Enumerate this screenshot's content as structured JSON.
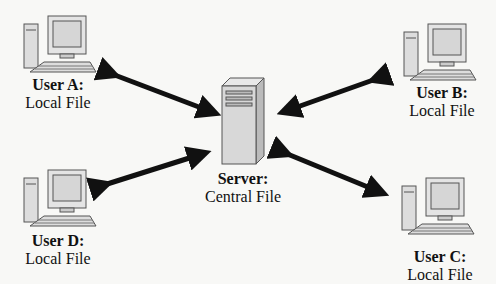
{
  "diagram": {
    "server": {
      "title": "Server:",
      "subtitle": "Central File"
    },
    "users": [
      {
        "id": "a",
        "title": "User A:",
        "subtitle": "Local File"
      },
      {
        "id": "b",
        "title": "User B:",
        "subtitle": "Local File"
      },
      {
        "id": "c",
        "title": "User C:",
        "subtitle": "Local File"
      },
      {
        "id": "d",
        "title": "User D:",
        "subtitle": "Local File"
      }
    ],
    "connections": [
      {
        "from": "user-a",
        "to": "server",
        "type": "bidirectional"
      },
      {
        "from": "user-b",
        "to": "server",
        "type": "bidirectional"
      },
      {
        "from": "user-c",
        "to": "server",
        "type": "bidirectional"
      },
      {
        "from": "user-d",
        "to": "server",
        "type": "bidirectional"
      }
    ]
  }
}
